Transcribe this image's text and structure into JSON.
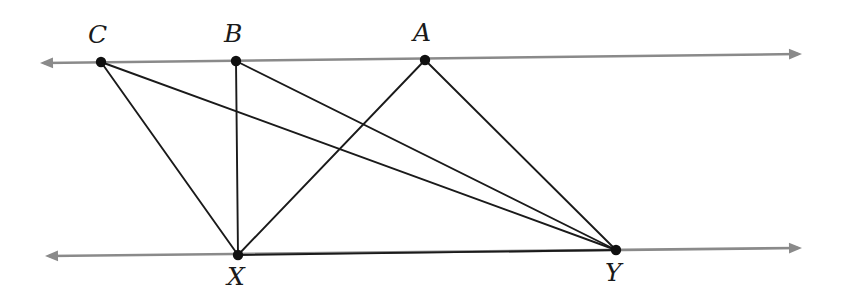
{
  "figure": {
    "canvas": {
      "width": 841,
      "height": 300
    },
    "colors": {
      "background": "#ffffff",
      "guide_line": "#8a8a8a",
      "segment": "#1a1a1a",
      "point": "#101010",
      "label": "#1a1a1a"
    },
    "stroke_widths": {
      "guide_line": 2.6,
      "segment": 1.9
    },
    "point_radius": 5.2
  },
  "lines": [
    {
      "name": "top-line",
      "label": "top guide line",
      "x1": 40,
      "y1": 63,
      "x2": 802,
      "y2": 54,
      "arrow_start": true,
      "arrow_end": true,
      "color": "#8a8a8a"
    },
    {
      "name": "bottom-line",
      "label": "bottom guide line",
      "x1": 45,
      "y1": 256,
      "x2": 802,
      "y2": 248,
      "arrow_start": true,
      "arrow_end": true,
      "color": "#8a8a8a"
    }
  ],
  "points": [
    {
      "id": "C",
      "label": "C",
      "x": 101,
      "y": 62,
      "label_x": 88,
      "label_y": 22,
      "on_line": "top-line"
    },
    {
      "id": "B",
      "label": "B",
      "x": 236,
      "y": 61,
      "label_x": 224,
      "label_y": 21,
      "on_line": "top-line"
    },
    {
      "id": "A",
      "label": "A",
      "x": 425,
      "y": 60,
      "label_x": 413,
      "label_y": 20,
      "on_line": "top-line"
    },
    {
      "id": "X",
      "label": "X",
      "x": 238,
      "y": 255,
      "label_x": 227,
      "label_y": 264,
      "on_line": "bottom-line"
    },
    {
      "id": "Y",
      "label": "Y",
      "x": 616,
      "y": 250,
      "label_x": 605,
      "label_y": 260,
      "on_line": "bottom-line"
    }
  ],
  "segments": [
    {
      "name": "segment-CX",
      "label": "CX",
      "from": "C",
      "to": "X",
      "x1": 101,
      "y1": 62,
      "x2": 238,
      "y2": 255
    },
    {
      "name": "segment-CY",
      "label": "CY",
      "from": "C",
      "to": "Y",
      "x1": 101,
      "y1": 62,
      "x2": 616,
      "y2": 250
    },
    {
      "name": "segment-BX",
      "label": "BX",
      "from": "B",
      "to": "X",
      "x1": 236,
      "y1": 61,
      "x2": 238,
      "y2": 255
    },
    {
      "name": "segment-BY",
      "label": "BY",
      "from": "B",
      "to": "Y",
      "x1": 236,
      "y1": 61,
      "x2": 616,
      "y2": 250
    },
    {
      "name": "segment-AX",
      "label": "AX",
      "from": "A",
      "to": "X",
      "x1": 425,
      "y1": 60,
      "x2": 238,
      "y2": 255
    },
    {
      "name": "segment-AY",
      "label": "AY",
      "from": "A",
      "to": "Y",
      "x1": 425,
      "y1": 60,
      "x2": 616,
      "y2": 250
    },
    {
      "name": "segment-XY",
      "label": "XY",
      "from": "X",
      "to": "Y",
      "x1": 238,
      "y1": 255,
      "x2": 616,
      "y2": 250
    }
  ]
}
